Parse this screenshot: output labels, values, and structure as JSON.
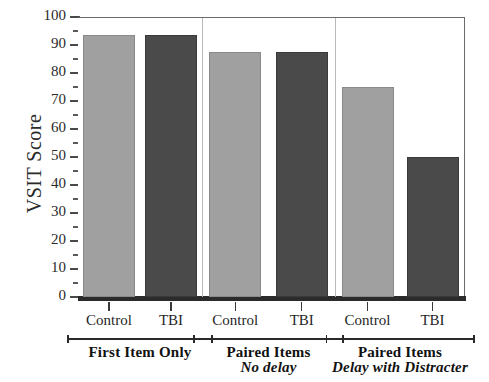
{
  "chart_data": {
    "type": "bar",
    "title": "",
    "xlabel": "",
    "ylabel": "VSIT Score",
    "ylim": [
      0,
      100
    ],
    "ytick_step": 10,
    "yminor_step": 5,
    "grid": false,
    "legend": "none",
    "panels": [
      {
        "group_main": "First Item Only",
        "group_sub": "",
        "categories": [
          "Control",
          "TBI"
        ],
        "values": [
          93.5,
          93.5
        ]
      },
      {
        "group_main": "Paired Items",
        "group_sub": "No delay",
        "categories": [
          "Control",
          "TBI"
        ],
        "values": [
          87.5,
          87.5
        ]
      },
      {
        "group_main": "Paired Items",
        "group_sub": "Delay with Distracter",
        "categories": [
          "Control",
          "TBI"
        ],
        "values": [
          75,
          50
        ]
      }
    ],
    "series": [
      {
        "name": "Control",
        "values": [
          93.5,
          87.5,
          75
        ]
      },
      {
        "name": "TBI",
        "values": [
          93.5,
          87.5,
          50
        ]
      }
    ],
    "ytick_labels": [
      "0",
      "10",
      "20",
      "30",
      "40",
      "50",
      "60",
      "70",
      "80",
      "90",
      "100"
    ],
    "colors": {
      "control_bar": "#a0a0a0",
      "tbi_bar": "#4a4a4a",
      "axis": "#4a4a4a",
      "baseline": "#2b2b2b",
      "separator": "#b9b9b9",
      "text": "#1f1f1f"
    }
  }
}
